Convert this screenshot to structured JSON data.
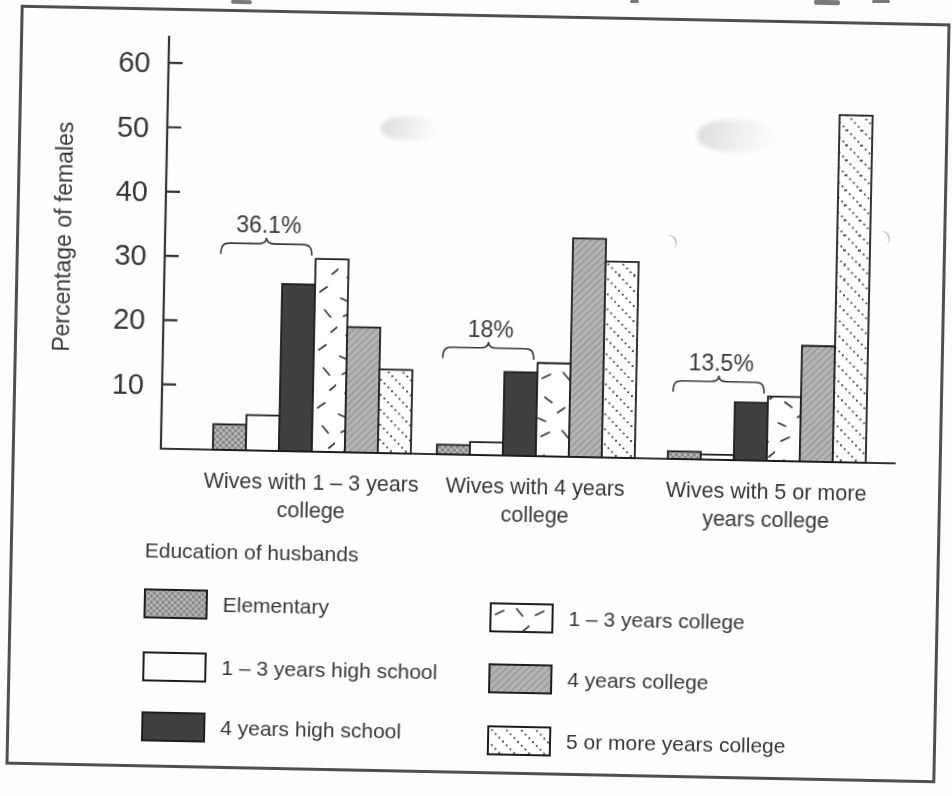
{
  "chart_data": {
    "type": "bar",
    "title": "",
    "ylabel": "Percentage of females",
    "yticks": [
      10,
      20,
      30,
      40,
      50,
      60
    ],
    "ylim": [
      0,
      65
    ],
    "grid": false,
    "categories": [
      "Wives with 1 – 3 years college",
      "Wives with 4 years college",
      "Wives with 5 or more years college"
    ],
    "category_lines": [
      [
        "Wives with 1 – 3 years",
        "college"
      ],
      [
        "Wives with 4 years",
        "college"
      ],
      [
        "Wives with 5 or more",
        "years college"
      ]
    ],
    "series": [
      {
        "name": "Elementary",
        "pattern": "dotted-gray",
        "values": [
          4,
          1.5,
          1.2
        ]
      },
      {
        "name": "1 – 3 years high school",
        "pattern": "white",
        "values": [
          5.5,
          2,
          0.8
        ]
      },
      {
        "name": "4 years high school",
        "pattern": "solid-dark",
        "values": [
          26,
          13,
          9
        ]
      },
      {
        "name": "1 – 3 years college",
        "pattern": "dash-marks",
        "values": [
          30,
          14.5,
          10
        ]
      },
      {
        "name": "4 years college",
        "pattern": "gray-hatch",
        "values": [
          19.5,
          34,
          18
        ]
      },
      {
        "name": "5 or more years college",
        "pattern": "diag-dots",
        "values": [
          13,
          30.5,
          54
        ]
      }
    ],
    "annotations": [
      {
        "text": "36.1%",
        "group": 0,
        "over_series": [
          0,
          1,
          2
        ]
      },
      {
        "text": "18%",
        "group": 1,
        "over_series": [
          0,
          1,
          2
        ]
      },
      {
        "text": "13.5%",
        "group": 2,
        "over_series": [
          0,
          1,
          2
        ]
      }
    ],
    "legend": {
      "title": "Education of husbands",
      "position": "bottom"
    },
    "colors": {
      "ink": "#373737",
      "axis": "#333333",
      "bar_outline": "#1d1d1d",
      "bar_dark": "#404040",
      "bar_gray": "#b5b5b5",
      "bar_dotted_gray": "#a3a3a3",
      "bar_white": "#fdfdfd",
      "frame": "#4f4f4f"
    }
  }
}
